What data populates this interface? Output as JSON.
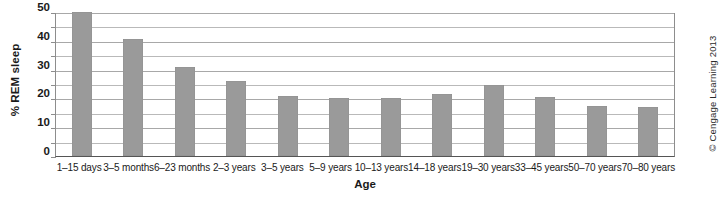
{
  "chart_data": {
    "type": "bar",
    "title": "",
    "xlabel": "Age",
    "ylabel": "% REM sleep",
    "categories": [
      "1–15 days",
      "3–5 months",
      "6–23 months",
      "2–3 years",
      "3–5 years",
      "5–9 years",
      "10–13 years",
      "14–18 years",
      "19–30 years",
      "33–45 years",
      "50–70 years",
      "70–80 years"
    ],
    "values": [
      50,
      40.5,
      31,
      26,
      21,
      20,
      20,
      21.5,
      24.5,
      20.5,
      17.5,
      17
    ],
    "ylim": [
      0,
      50
    ],
    "ytick_labels": [
      "0",
      "10",
      "20",
      "30",
      "40",
      "50"
    ],
    "ytick_values": [
      0,
      10,
      20,
      30,
      40,
      50
    ],
    "gridline_values": [
      5,
      10,
      15,
      20,
      25,
      30,
      35,
      40,
      45,
      50
    ],
    "grid": true,
    "legend": "none",
    "bar_color": "#9a9a9a",
    "axis_color": "#8d8d8d",
    "grid_color": "#b9b9b9",
    "background": "#ffffff"
  },
  "credit": {
    "text": "© Cengage Learning 2013"
  }
}
